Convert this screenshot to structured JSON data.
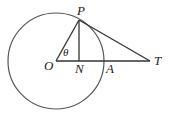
{
  "diagram": {
    "type": "geometry",
    "colors": {
      "circle": "#555555",
      "lines": "#333333",
      "labels": "#1a1a1a",
      "background": "#ffffff"
    },
    "circle": {
      "center": "O",
      "cx": 56,
      "cy": 61,
      "r": 48
    },
    "points": {
      "O": {
        "x": 56,
        "y": 61,
        "label": "O"
      },
      "P": {
        "x": 79,
        "y": 20,
        "label": "P"
      },
      "N": {
        "x": 79,
        "y": 61,
        "label": "N"
      },
      "A": {
        "x": 104,
        "y": 61,
        "label": "A"
      },
      "T": {
        "x": 150,
        "y": 61,
        "label": "T"
      }
    },
    "segments": [
      {
        "from": "O",
        "to": "P",
        "name": "radius-OP"
      },
      {
        "from": "P",
        "to": "N",
        "name": "perpendicular-PN"
      },
      {
        "from": "O",
        "to": "T",
        "name": "line-OT"
      },
      {
        "from": "P",
        "to": "T",
        "name": "tangent-PT"
      }
    ],
    "angle": {
      "vertex": "O",
      "label": "θ"
    }
  }
}
